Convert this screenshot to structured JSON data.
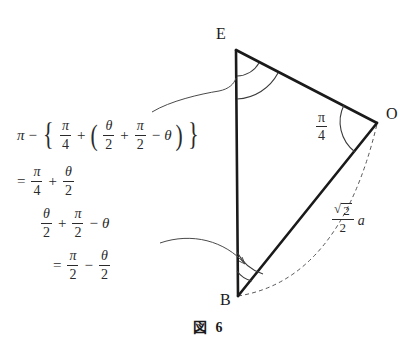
{
  "figure": {
    "caption_label": "図",
    "caption_number": "6",
    "vertices": [
      {
        "name": "E",
        "label": "E",
        "x": 236,
        "y": 50
      },
      {
        "name": "O",
        "label": "O",
        "x": 376,
        "y": 122
      },
      {
        "name": "B",
        "label": "B",
        "x": 238,
        "y": 296
      }
    ],
    "angle_at_O": {
      "numerator": "π",
      "denominator": "4"
    },
    "side_BO_length": {
      "radicand": "2",
      "radical_sign": "√",
      "denominator": "2",
      "variable": "a"
    },
    "colors": {
      "ink": "#1f1f1f",
      "line": "#1a1a1a",
      "thin_line": "#4a4a4a",
      "background": "#ffffff"
    }
  },
  "derivation": {
    "line1": {
      "pi": "π",
      "minus": "−",
      "brace_open": "{",
      "frac_pi_4": {
        "num": "π",
        "den": "4"
      },
      "plus": "+",
      "paren_open": "(",
      "frac_theta_2": {
        "num": "θ",
        "den": "2"
      },
      "plus2": "+",
      "frac_pi_2": {
        "num": "π",
        "den": "2"
      },
      "minus2": "−",
      "theta": "θ",
      "paren_close": ")",
      "brace_close": "}"
    },
    "line2": {
      "equals": "=",
      "frac_pi_4": {
        "num": "π",
        "den": "4"
      },
      "plus": "+",
      "frac_theta_2": {
        "num": "θ",
        "den": "2"
      }
    },
    "line3": {
      "frac_theta_2": {
        "num": "θ",
        "den": "2"
      },
      "plus": "+",
      "frac_pi_2": {
        "num": "π",
        "den": "2"
      },
      "minus": "−",
      "theta": "θ"
    },
    "line4": {
      "equals": "=",
      "frac_pi_2": {
        "num": "π",
        "den": "2"
      },
      "minus": "−",
      "frac_theta_2": {
        "num": "θ",
        "den": "2"
      }
    }
  }
}
